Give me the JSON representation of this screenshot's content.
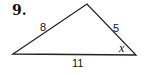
{
  "problem": {
    "number": "9.",
    "figure": "triangle",
    "sides": {
      "left": "8",
      "right": "5",
      "bottom": "11"
    },
    "angle_label": "x",
    "stroke_color": "#222222"
  }
}
